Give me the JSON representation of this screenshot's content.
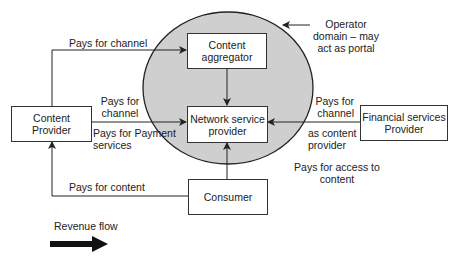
{
  "diagram": {
    "domain_label": [
      "Operator",
      "domain – may",
      "act as portal"
    ],
    "nodes": {
      "content_aggregator": [
        "Content",
        "aggregator"
      ],
      "network_service_provider": [
        "Network service",
        "provider"
      ],
      "content_provider": [
        "Content",
        "Provider"
      ],
      "financial_services_provider": [
        "Financial services",
        "Provider"
      ],
      "consumer": [
        "Consumer"
      ]
    },
    "edges": {
      "cp_to_aggregator": "Pays for channel",
      "cp_to_nsp_top": [
        "Pays for",
        "channel"
      ],
      "cp_to_nsp_bottom": [
        "Pays for Payment",
        "services"
      ],
      "fsp_to_nsp_top": [
        "Pays for",
        "channel"
      ],
      "fsp_to_nsp_bottom": [
        "as content",
        "provider"
      ],
      "consumer_to_nsp": [
        "Pays for access to",
        "content"
      ],
      "consumer_to_cp": "Pays for content"
    },
    "legend": {
      "label": "Revenue flow",
      "icon": "thick-right-arrow"
    },
    "colors": {
      "domain_fill": "#cfcfcf",
      "stroke": "#222222",
      "box_fill": "#ffffff"
    }
  }
}
